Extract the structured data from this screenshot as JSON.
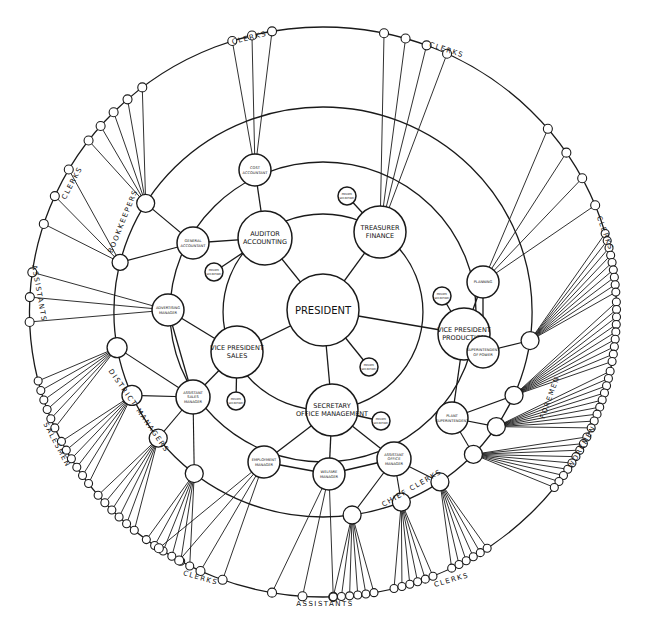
{
  "diagram": {
    "type": "circular-organization-chart",
    "center": {
      "id": "president",
      "label": "PRESIDENT",
      "x": 323,
      "y": 310,
      "r": 36
    },
    "executives": [
      {
        "id": "auditor",
        "lines": [
          "AUDITOR",
          "ACCOUNTING"
        ],
        "x": 265,
        "y": 238,
        "r": 27
      },
      {
        "id": "treasurer",
        "lines": [
          "TREASURER",
          "FINANCE"
        ],
        "x": 380,
        "y": 232,
        "r": 26
      },
      {
        "id": "vp-sales",
        "lines": [
          "VICE PRESIDENT",
          "SALES"
        ],
        "x": 237,
        "y": 352,
        "r": 26
      },
      {
        "id": "vp-production",
        "lines": [
          "VICE PRESIDENT",
          "PRODUCTION"
        ],
        "x": 464,
        "y": 334,
        "r": 26
      },
      {
        "id": "secretary",
        "lines": [
          "SECRETARY",
          "OFFICE MANAGEMENT"
        ],
        "x": 332,
        "y": 410,
        "r": 26
      }
    ],
    "private_secretaries": [
      {
        "id": "ps-auditor",
        "lines": [
          "PRIVATE",
          "SECRETARY"
        ],
        "x": 214,
        "y": 272,
        "r": 9
      },
      {
        "id": "ps-treasurer",
        "lines": [
          "PRIVATE",
          "SECRETARY"
        ],
        "x": 347,
        "y": 196,
        "r": 9
      },
      {
        "id": "ps-president",
        "lines": [
          "PRIVATE",
          "SECRETARY"
        ],
        "x": 369,
        "y": 367,
        "r": 9
      },
      {
        "id": "ps-vp-sales",
        "lines": [
          "PRIVATE",
          "SECRETARY"
        ],
        "x": 236,
        "y": 401,
        "r": 9
      },
      {
        "id": "ps-vp-production",
        "lines": [
          "PRIVATE",
          "SECRETARY"
        ],
        "x": 442,
        "y": 296,
        "r": 9
      },
      {
        "id": "ps-secretary",
        "lines": [
          "PRIVATE",
          "SECRETARY"
        ],
        "x": 381,
        "y": 421,
        "r": 9
      }
    ],
    "managers": [
      {
        "id": "cost-accountant",
        "lines": [
          "COST",
          "ACCOUNTANT"
        ],
        "x": 255,
        "y": 170,
        "r": 16
      },
      {
        "id": "general-accountant",
        "lines": [
          "GENERAL",
          "ACCOUNTANT"
        ],
        "x": 193,
        "y": 243,
        "r": 16
      },
      {
        "id": "advertising-manager",
        "lines": [
          "ADVERTISING",
          "MANAGER"
        ],
        "x": 168,
        "y": 310,
        "r": 16
      },
      {
        "id": "assistant-sales-manager",
        "lines": [
          "ASSISTANT",
          "SALES",
          "MANAGER"
        ],
        "x": 193,
        "y": 397,
        "r": 17
      },
      {
        "id": "employment-manager",
        "lines": [
          "EMPLOYMENT",
          "MANAGER"
        ],
        "x": 264,
        "y": 462,
        "r": 16
      },
      {
        "id": "welfare-manager",
        "lines": [
          "WELFARE",
          "MANAGER"
        ],
        "x": 329,
        "y": 474,
        "r": 16
      },
      {
        "id": "assistant-office-manager",
        "lines": [
          "ASSISTANT",
          "OFFICE",
          "MANAGER"
        ],
        "x": 394,
        "y": 459,
        "r": 17
      },
      {
        "id": "plant-superintendent",
        "lines": [
          "PLANT",
          "SUPERINTENDENT"
        ],
        "x": 452,
        "y": 418,
        "r": 16
      },
      {
        "id": "superintendent-of-power",
        "lines": [
          "SUPERINTENDENT",
          "OF POWER"
        ],
        "x": 483,
        "y": 352,
        "r": 16
      },
      {
        "id": "planning",
        "lines": [
          "PLANNING"
        ],
        "x": 483,
        "y": 282,
        "r": 16
      }
    ],
    "ring_labels": [
      {
        "id": "clerks-top-left",
        "text": "CLERKS",
        "x": 250,
        "y": 40,
        "rot": -14
      },
      {
        "id": "clerks-top-right",
        "text": "CLERKS",
        "x": 446,
        "y": 52,
        "rot": 18
      },
      {
        "id": "clerks-left",
        "text": "CLERKS",
        "x": 74,
        "y": 184,
        "rot": -62
      },
      {
        "id": "bookkeepers",
        "text": "BOOKKEEPERS",
        "x": 125,
        "y": 222,
        "rot": -68
      },
      {
        "id": "assistants-left",
        "text": "ASSISTANTS",
        "x": 37,
        "y": 294,
        "rot": 80
      },
      {
        "id": "clerks-right",
        "text": "CLERKS",
        "x": 603,
        "y": 234,
        "rot": 70
      },
      {
        "id": "district-managers",
        "text": "DISTRICT MANAGERS",
        "x": 137,
        "y": 412,
        "rot": 55
      },
      {
        "id": "salesmen",
        "text": "SALESMEN",
        "x": 55,
        "y": 446,
        "rot": 62
      },
      {
        "id": "foremen",
        "text": "FOREMEN",
        "x": 552,
        "y": 398,
        "rot": -70
      },
      {
        "id": "workmen",
        "text": "WORKMEN",
        "x": 584,
        "y": 448,
        "rot": -60
      },
      {
        "id": "chief-clerks",
        "text": "CHIEF CLERKS",
        "x": 413,
        "y": 490,
        "rot": -30
      },
      {
        "id": "clerks-bottom-left",
        "text": "CLERKS",
        "x": 200,
        "y": 580,
        "rot": 16
      },
      {
        "id": "assistants-bottom",
        "text": "ASSISTANTS",
        "x": 325,
        "y": 606,
        "rot": 0
      },
      {
        "id": "clerks-bottom-right",
        "text": "CLERKS",
        "x": 452,
        "y": 582,
        "rot": -16
      }
    ],
    "rings": [
      {
        "id": "ring-inner",
        "r": 98
      },
      {
        "id": "ring-2",
        "r": 150
      },
      {
        "id": "ring-3",
        "r": 205
      },
      {
        "id": "ring-outer",
        "r": 285
      }
    ],
    "colors": {
      "ink": "#1a1a1a",
      "paper": "#ffffff"
    }
  }
}
